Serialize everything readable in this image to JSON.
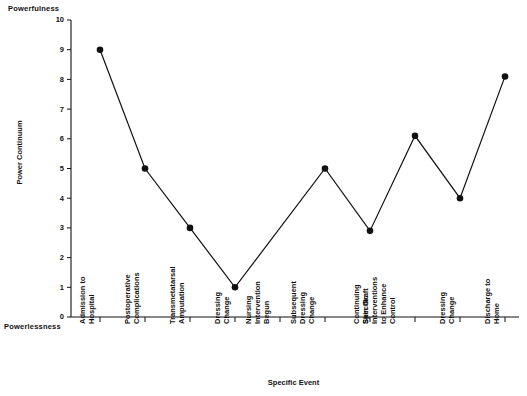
{
  "chart_data": {
    "type": "line",
    "title": "",
    "xlabel": "Specific Event",
    "ylabel": "Power Continuum",
    "ylim": [
      0,
      10
    ],
    "yticks": [
      0,
      1,
      2,
      3,
      4,
      5,
      6,
      7,
      8,
      9,
      10
    ],
    "grid": false,
    "legend": null,
    "axis_top_annotation": "Powerfulness",
    "axis_bottom_annotation": "Powerlessness",
    "marker_color": "#111111",
    "line_color": "#111111",
    "categories": [
      "Admission to Hospital",
      "Postoperative Complications",
      "Transmetatarsal Amputation",
      "Dressing Change",
      "Nursing Intervention Begun",
      "Subsequent Dressing Change",
      "Skin Graft",
      "Continuing Specific Interventions to Enhance Control",
      "Dressing Change",
      "Discharge to Home"
    ],
    "category_lines": [
      [
        "Admission to",
        "Hospital"
      ],
      [
        "Postoperative",
        "Complications"
      ],
      [
        "Transmetatarsal",
        "Amputation"
      ],
      [
        "Dressing",
        "Change"
      ],
      [
        "Nursing",
        "Intervention",
        "Begun"
      ],
      [
        "Subsequent",
        "Dressing",
        "Change"
      ],
      [
        "Skin Graft"
      ],
      [
        "Continuing",
        "Specific",
        "Interventions",
        "to Enhance",
        "Control"
      ],
      [
        "Dressing",
        "Change"
      ],
      [
        "Discharge to",
        "Home"
      ]
    ],
    "values": [
      9,
      5,
      3,
      1,
      null,
      5,
      2.9,
      6.1,
      4,
      8.1
    ],
    "markers_shown": [
      true,
      true,
      true,
      true,
      false,
      true,
      true,
      true,
      true,
      true
    ]
  }
}
